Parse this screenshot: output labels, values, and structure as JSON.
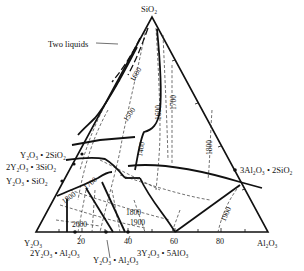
{
  "diagram": {
    "title": "",
    "type": "ternary phase diagram",
    "vertices": {
      "top": "SiO₂",
      "bottom_left": "Y₂O₃",
      "bottom_right": "Al₂O₃"
    },
    "base_ticks": [
      "20",
      "40",
      "60",
      "80"
    ],
    "compounds": {
      "y2o3_2sio2": "Y₂O₃ • 2SiO₂",
      "2y2o3_3sio2": "2Y₂O₃ • 3SiO₂",
      "y2o3_sio2": "Y₂O₃ • SiO₂",
      "2y2o3_al2o3": "2Y₂O₃ • Al₂O₃",
      "y2o3_al2o3": "Y₂O₃ • Al₂O₃",
      "3y2o3_5alo3": "3Y₂O₃ • 5AlO₃",
      "3al2o3_2sio2": "3Al₂O₃ • 2SiO₂"
    },
    "annotations": {
      "two_liquids": "Two liquids"
    },
    "isotherms": [
      "1600",
      "1500",
      "1400",
      "1600",
      "1700",
      "1800",
      "1700",
      "1800",
      "1800",
      "1900",
      "1900",
      "2000"
    ]
  }
}
